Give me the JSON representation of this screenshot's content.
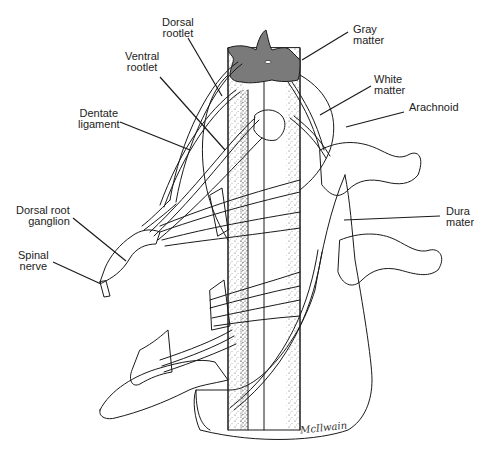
{
  "figure": {
    "colors": {
      "gray_matter": "#7a7a7a",
      "stipple": "#555555",
      "outline": "#1a1a1a",
      "label_text": "#222222",
      "background": "#ffffff"
    },
    "labels": [
      {
        "id": "dorsal-rootlet",
        "line1": "Dorsal",
        "line2": "rootlet"
      },
      {
        "id": "ventral-rootlet",
        "line1": "Ventral",
        "line2": "rootlet"
      },
      {
        "id": "gray-matter",
        "line1": "Gray",
        "line2": "matter"
      },
      {
        "id": "white-matter",
        "line1": "White",
        "line2": "matter"
      },
      {
        "id": "arachnoid",
        "line1": "Arachnoid",
        "line2": ""
      },
      {
        "id": "dentate-ligament",
        "line1": "Dentate",
        "line2": "ligament"
      },
      {
        "id": "dorsal-root-ganglion",
        "line1": "Dorsal root",
        "line2": "ganglion"
      },
      {
        "id": "spinal-nerve",
        "line1": "Spinal",
        "line2": "nerve"
      },
      {
        "id": "dura-mater",
        "line1": "Dura",
        "line2": "mater"
      }
    ],
    "signature": "McIlwain"
  }
}
